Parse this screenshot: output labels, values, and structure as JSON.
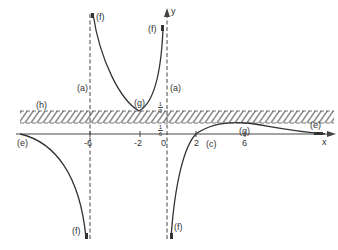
{
  "diagram": {
    "type": "function-sketch",
    "axes": {
      "x_label": "x",
      "y_label": "y",
      "x_ticks": [
        "-6",
        "-2",
        "0",
        "2",
        "6"
      ],
      "y_ticks": [
        {
          "num": "1",
          "den": "3"
        },
        {
          "num": "1",
          "den": "6"
        }
      ]
    },
    "labels": {
      "a_left": "(a)",
      "a_right": "(a)",
      "f_top_left": "(f)",
      "f_top_right": "(f)",
      "f_bottom_left": "(f)",
      "f_bottom_right": "(f)",
      "g_left": "(g)",
      "g_right": "(g)",
      "h": "(h)",
      "e_left": "(e)",
      "e_right": "(e)",
      "c": "(c)"
    },
    "colors": {
      "curve": "#333333",
      "axis": "#444444",
      "hatch": "#555555"
    }
  }
}
